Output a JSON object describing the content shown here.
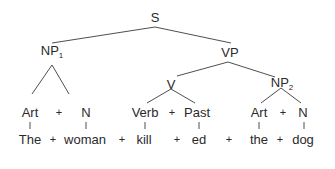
{
  "diagram": {
    "type": "syntax-tree",
    "root": {
      "label": "S",
      "children": [
        {
          "label": "NP",
          "sub": "1",
          "children": [
            {
              "label": "Art",
              "word": "The"
            },
            {
              "label": "N",
              "word": "woman"
            }
          ]
        },
        {
          "label": "VP",
          "children": [
            {
              "label": "V",
              "children": [
                {
                  "label": "Verb",
                  "word": "kill"
                },
                {
                  "label": "Past",
                  "word": "ed"
                }
              ]
            },
            {
              "label": "NP",
              "sub": "2",
              "children": [
                {
                  "label": "Art",
                  "word": "the"
                },
                {
                  "label": "N",
                  "word": "dog"
                }
              ]
            }
          ]
        }
      ]
    },
    "nodes": {
      "s": "S",
      "np1": "NP",
      "np1_sub": "1",
      "vp": "VP",
      "v": "V",
      "np2": "NP",
      "np2_sub": "2",
      "art1": "Art",
      "n1": "N",
      "verb": "Verb",
      "past": "Past",
      "art2": "Art",
      "n2": "N"
    },
    "words": {
      "the1": "The",
      "woman": "woman",
      "kill": "kill",
      "ed": "ed",
      "the2": "the",
      "dog": "dog"
    },
    "plus": "+",
    "line_color": "#3a3a3a"
  }
}
